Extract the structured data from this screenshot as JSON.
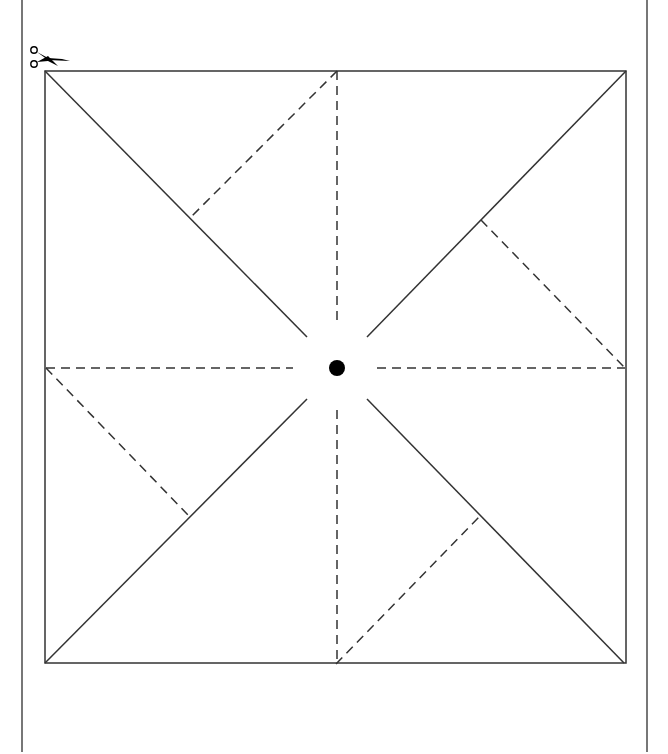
{
  "diagram": {
    "type": "pinwheel-template",
    "colors": {
      "background": "#ffffff",
      "line": "#333333",
      "page_border": "#777777",
      "center_dot": "#000000"
    },
    "page_border": {
      "left_x": 22,
      "right_x": 647,
      "top": 0,
      "bottom": 752
    },
    "square": {
      "x1": 45,
      "y1": 71,
      "x2": 626,
      "y2": 663
    },
    "center": {
      "x": 337,
      "y": 368,
      "dot_radius": 8
    },
    "solid_cut_lines": [
      {
        "from": [
          45,
          71
        ],
        "to": [
          307,
          337
        ]
      },
      {
        "from": [
          626,
          71
        ],
        "to": [
          367,
          337
        ]
      },
      {
        "from": [
          45,
          663
        ],
        "to": [
          307,
          399
        ]
      },
      {
        "from": [
          624,
          663
        ],
        "to": [
          367,
          399
        ]
      }
    ],
    "dashed_fold_lines": [
      {
        "from": [
          337,
          71
        ],
        "to": [
          337,
          322
        ]
      },
      {
        "from": [
          337,
          410
        ],
        "to": [
          337,
          663
        ]
      },
      {
        "from": [
          46,
          368
        ],
        "to": [
          293,
          368
        ]
      },
      {
        "from": [
          377,
          368
        ],
        "to": [
          625,
          368
        ]
      },
      {
        "from": [
          337,
          71
        ],
        "to": [
          192,
          216
        ]
      },
      {
        "from": [
          481,
          220
        ],
        "to": [
          625,
          368
        ]
      },
      {
        "from": [
          46,
          368
        ],
        "to": [
          189,
          516
        ]
      },
      {
        "from": [
          336,
          664
        ],
        "to": [
          480,
          516
        ]
      }
    ],
    "scissors_icon": {
      "x": 30,
      "y": 44,
      "label": "cut here"
    }
  }
}
